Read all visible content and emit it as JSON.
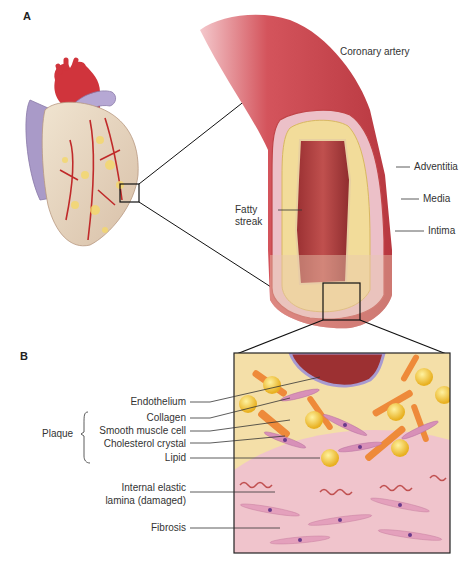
{
  "figure": {
    "panel_a": {
      "letter": "A",
      "title_label": "Coronary artery",
      "labels": {
        "adventitia": "Adventitia",
        "media": "Media",
        "intima": "Intima",
        "fatty_streak_line1": "Fatty",
        "fatty_streak_line2": "streak"
      }
    },
    "panel_b": {
      "letter": "B",
      "group_label": "Plaque",
      "labels": {
        "endothelium": "Endothelium",
        "collagen": "Collagen",
        "smooth_muscle_cell": "Smooth muscle cell",
        "cholesterol_crystal": "Cholesterol crystal",
        "lipid": "Lipid",
        "iel_line1": "Internal elastic",
        "iel_line2": "lamina (damaged)",
        "fibrosis": "Fibrosis"
      }
    },
    "colors": {
      "artery_red": "#c8424a",
      "lumen_red": "#a8383a",
      "fat_yellow": "#f2dc9a",
      "wall_pink": "#eab7c4",
      "vein_purple": "#a99ac8",
      "muscle_pink": "#e9a8c0",
      "crystal_orange": "#ee8a3a",
      "lipid_gold": "#f3c43a",
      "nucleus_purple": "#6a3a8a"
    }
  }
}
